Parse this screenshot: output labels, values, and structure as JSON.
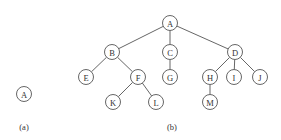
{
  "diagram": {
    "type": "tree",
    "node_radius": 7.5,
    "colors": {
      "stroke": "#555555",
      "text": "#333333",
      "background": "#ffffff"
    },
    "panels": [
      {
        "id": "a",
        "caption": "(a)",
        "caption_pos": [
          24,
          127
        ],
        "nodes": [
          {
            "id": "a_A",
            "label": "A",
            "x": 24,
            "y": 94
          }
        ],
        "edges": []
      },
      {
        "id": "b",
        "caption": "(b)",
        "caption_pos": [
          172,
          127
        ],
        "nodes": [
          {
            "id": "A",
            "label": "A",
            "x": 170,
            "y": 23
          },
          {
            "id": "B",
            "label": "B",
            "x": 112,
            "y": 52
          },
          {
            "id": "C",
            "label": "C",
            "x": 170,
            "y": 52
          },
          {
            "id": "D",
            "label": "D",
            "x": 235,
            "y": 52
          },
          {
            "id": "E",
            "label": "E",
            "x": 86,
            "y": 77
          },
          {
            "id": "F",
            "label": "F",
            "x": 138,
            "y": 77
          },
          {
            "id": "G",
            "label": "G",
            "x": 170,
            "y": 77
          },
          {
            "id": "H",
            "label": "H",
            "x": 210,
            "y": 77
          },
          {
            "id": "I",
            "label": "I",
            "x": 234,
            "y": 77
          },
          {
            "id": "J",
            "label": "J",
            "x": 260,
            "y": 77
          },
          {
            "id": "K",
            "label": "K",
            "x": 113,
            "y": 102
          },
          {
            "id": "L",
            "label": "L",
            "x": 156,
            "y": 102
          },
          {
            "id": "M",
            "label": "M",
            "x": 210,
            "y": 102
          }
        ],
        "edges": [
          [
            "A",
            "B"
          ],
          [
            "A",
            "C"
          ],
          [
            "A",
            "D"
          ],
          [
            "B",
            "E"
          ],
          [
            "B",
            "F"
          ],
          [
            "C",
            "G"
          ],
          [
            "D",
            "H"
          ],
          [
            "D",
            "I"
          ],
          [
            "D",
            "J"
          ],
          [
            "F",
            "K"
          ],
          [
            "F",
            "L"
          ],
          [
            "H",
            "M"
          ]
        ]
      }
    ]
  }
}
